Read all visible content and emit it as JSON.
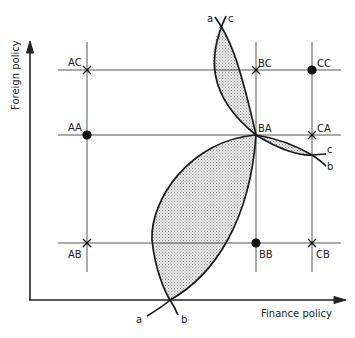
{
  "axes": {
    "x_label": "Finance policy",
    "y_label": "Foreign policy"
  },
  "grid_points": {
    "AC": "AC",
    "BC": "BC",
    "CC": "CC",
    "AA": "AA",
    "BA": "BA",
    "CA": "CA",
    "AB": "AB",
    "BB": "BB",
    "CB": "CB"
  },
  "curve_labels": {
    "top_a": "a",
    "top_c": "c",
    "right_c": "c",
    "right_b": "b",
    "bottom_a": "a",
    "bottom_b": "b"
  },
  "markers": {
    "filled_dots": [
      "AA",
      "CC",
      "BB"
    ],
    "crosses": [
      "AC",
      "BC",
      "CA",
      "AB",
      "CB"
    ],
    "intersection": [
      "BA"
    ]
  },
  "colors": {
    "line": "#222222",
    "shading": "#bdbdbd"
  }
}
